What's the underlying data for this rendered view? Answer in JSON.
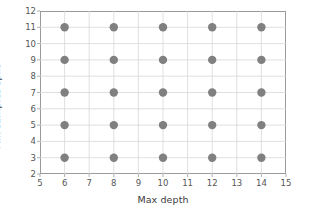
{
  "chart_data": {
    "type": "scatter",
    "title": "",
    "xlabel": "Max depth",
    "ylabel": "Min samples split",
    "xlim": [
      5,
      15
    ],
    "ylim": [
      2,
      12
    ],
    "xticks": [
      5,
      6,
      7,
      8,
      9,
      10,
      11,
      12,
      13,
      14,
      15
    ],
    "yticks": [
      2,
      3,
      4,
      5,
      6,
      7,
      8,
      9,
      10,
      11,
      12
    ],
    "xtick_labels": [
      "5",
      "6",
      "7",
      "8",
      "9",
      "10",
      "11",
      "12",
      "13",
      "14",
      "15"
    ],
    "ytick_labels": [
      "2",
      "3",
      "4",
      "5",
      "6",
      "7",
      "8",
      "9",
      "10",
      "11",
      "12"
    ],
    "grid": true,
    "legend": null,
    "marker": {
      "shape": "circle",
      "color": "#808080",
      "size": 4.2
    },
    "colors": {
      "marker": "#808080",
      "grid": "#d8d8d8",
      "spine": "#9a9a9a",
      "tick_label": "#555555",
      "axis_label": "#3b3b3b",
      "background": "#ffffff"
    },
    "x": [
      6,
      6,
      6,
      6,
      6,
      8,
      8,
      8,
      8,
      8,
      10,
      10,
      10,
      10,
      10,
      12,
      12,
      12,
      12,
      12,
      14,
      14,
      14,
      14,
      14
    ],
    "y": [
      3,
      5,
      7,
      9,
      11,
      3,
      5,
      7,
      9,
      11,
      3,
      5,
      7,
      9,
      11,
      3,
      5,
      7,
      9,
      11,
      3,
      5,
      7,
      9,
      11
    ],
    "points": [
      {
        "x": 6,
        "y": 3
      },
      {
        "x": 6,
        "y": 5
      },
      {
        "x": 6,
        "y": 7
      },
      {
        "x": 6,
        "y": 9
      },
      {
        "x": 6,
        "y": 11
      },
      {
        "x": 8,
        "y": 3
      },
      {
        "x": 8,
        "y": 5
      },
      {
        "x": 8,
        "y": 7
      },
      {
        "x": 8,
        "y": 9
      },
      {
        "x": 8,
        "y": 11
      },
      {
        "x": 10,
        "y": 3
      },
      {
        "x": 10,
        "y": 5
      },
      {
        "x": 10,
        "y": 7
      },
      {
        "x": 10,
        "y": 9
      },
      {
        "x": 10,
        "y": 11
      },
      {
        "x": 12,
        "y": 3
      },
      {
        "x": 12,
        "y": 5
      },
      {
        "x": 12,
        "y": 7
      },
      {
        "x": 12,
        "y": 9
      },
      {
        "x": 12,
        "y": 11
      },
      {
        "x": 14,
        "y": 3
      },
      {
        "x": 14,
        "y": 5
      },
      {
        "x": 14,
        "y": 7
      },
      {
        "x": 14,
        "y": 9
      },
      {
        "x": 14,
        "y": 11
      }
    ],
    "n_points": 25
  }
}
